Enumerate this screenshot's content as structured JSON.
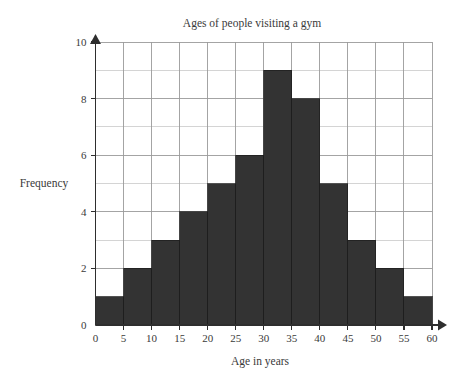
{
  "chart_data": {
    "type": "bar",
    "title": "Ages of people visiting a gym",
    "xlabel": "Age in years",
    "ylabel": "Frequency",
    "categories": [
      "0-5",
      "5-10",
      "10-15",
      "15-20",
      "20-25",
      "25-30",
      "30-35",
      "35-40",
      "40-45",
      "45-50",
      "50-55",
      "55-60"
    ],
    "bin_edges": [
      0,
      5,
      10,
      15,
      20,
      25,
      30,
      35,
      40,
      45,
      50,
      55,
      60
    ],
    "values": [
      1,
      2,
      3,
      4,
      5,
      6,
      9,
      8,
      5,
      3,
      2,
      1
    ],
    "xlim": [
      0,
      60
    ],
    "ylim": [
      0,
      10
    ],
    "xticks": [
      0,
      5,
      10,
      15,
      20,
      25,
      30,
      35,
      40,
      45,
      50,
      55,
      60
    ],
    "xtick_labels": [
      "0",
      "5",
      "10",
      "15",
      "20",
      "25",
      "30",
      "35",
      "40",
      "45",
      "50",
      "55",
      "60"
    ],
    "yticks": [
      0,
      2,
      4,
      6,
      8,
      10
    ],
    "ytick_labels": [
      "0",
      "2",
      "4",
      "6",
      "8",
      "10"
    ],
    "y_gridline_step": 1,
    "x_gridline_step": 5,
    "grid": true,
    "legend": "none",
    "bar_color": "#333333",
    "grid_color": "#c9c9c9",
    "axis_color": "#2e2e2e",
    "background_color": "#ffffff",
    "total_frequency": 45
  }
}
